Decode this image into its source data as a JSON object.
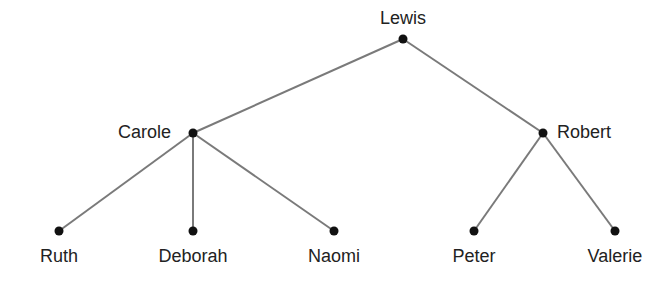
{
  "diagram": {
    "type": "tree",
    "colors": {
      "edge": "#7a7a7a",
      "node": "#111111",
      "text": "#222222"
    },
    "nodes": [
      {
        "id": "lewis",
        "label": "Lewis",
        "x": 403,
        "y": 39,
        "label_pos": "above"
      },
      {
        "id": "carole",
        "label": "Carole",
        "x": 193,
        "y": 133,
        "label_pos": "left"
      },
      {
        "id": "robert",
        "label": "Robert",
        "x": 543,
        "y": 133,
        "label_pos": "right"
      },
      {
        "id": "ruth",
        "label": "Ruth",
        "x": 59,
        "y": 231,
        "label_pos": "below"
      },
      {
        "id": "deborah",
        "label": "Deborah",
        "x": 193,
        "y": 231,
        "label_pos": "below"
      },
      {
        "id": "naomi",
        "label": "Naomi",
        "x": 334,
        "y": 231,
        "label_pos": "below"
      },
      {
        "id": "peter",
        "label": "Peter",
        "x": 474,
        "y": 231,
        "label_pos": "below"
      },
      {
        "id": "valerie",
        "label": "Valerie",
        "x": 615,
        "y": 231,
        "label_pos": "below"
      }
    ],
    "edges": [
      {
        "from": "lewis",
        "to": "carole"
      },
      {
        "from": "lewis",
        "to": "robert"
      },
      {
        "from": "carole",
        "to": "ruth"
      },
      {
        "from": "carole",
        "to": "deborah"
      },
      {
        "from": "carole",
        "to": "naomi"
      },
      {
        "from": "robert",
        "to": "peter"
      },
      {
        "from": "robert",
        "to": "valerie"
      }
    ]
  }
}
